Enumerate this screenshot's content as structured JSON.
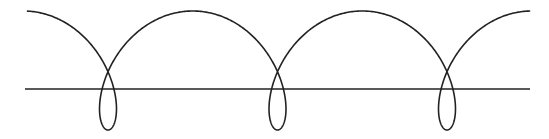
{
  "diagram": {
    "colors": {
      "background": "#ffffff",
      "stroke": "#222222"
    },
    "baseline": {
      "x1": 25,
      "x2": 530,
      "y": 89
    },
    "loops": [
      {
        "center_x": 108,
        "cross_y": 70,
        "bottom_y": 130
      },
      {
        "center_x": 278,
        "cross_y": 70,
        "bottom_y": 131
      },
      {
        "center_x": 447,
        "cross_y": 70,
        "bottom_y": 130
      }
    ],
    "arch_peaks": [
      {
        "x": 193,
        "y": 11
      },
      {
        "x": 362,
        "y": 11
      }
    ],
    "curve_ends": {
      "left": {
        "x": 19,
        "y": 13
      },
      "right": {
        "x": 530,
        "y": 12
      }
    }
  }
}
